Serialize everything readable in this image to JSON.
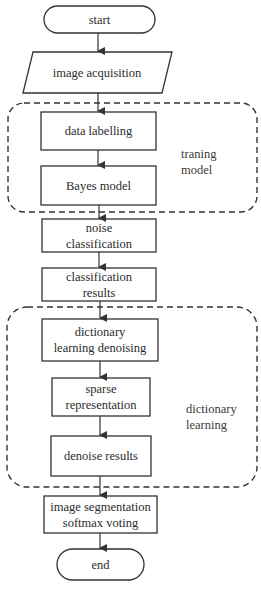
{
  "diagram": {
    "type": "flowchart",
    "stroke_color": "#333333",
    "background": "#ffffff",
    "nodes": [
      {
        "id": "start",
        "shape": "terminal",
        "label": "start"
      },
      {
        "id": "image_acquisition",
        "shape": "parallelogram",
        "label": "image acquisition"
      },
      {
        "id": "data_labelling",
        "shape": "process",
        "label": "data labelling"
      },
      {
        "id": "bayes_model",
        "shape": "process",
        "label": "Bayes model"
      },
      {
        "id": "noise_classification",
        "shape": "process",
        "label": "noise\nclassification"
      },
      {
        "id": "classification_results",
        "shape": "process",
        "label": "classification\nresults"
      },
      {
        "id": "dictionary_learning_denoising",
        "shape": "process",
        "label": "dictionary\nlearning denoising"
      },
      {
        "id": "sparse_representation",
        "shape": "process",
        "label": "sparse\nrepresentation"
      },
      {
        "id": "denoise_results",
        "shape": "process",
        "label": "denoise results"
      },
      {
        "id": "image_segmentation",
        "shape": "process",
        "label": "image segmentation\nsoftmax voting"
      },
      {
        "id": "end",
        "shape": "terminal",
        "label": "end"
      }
    ],
    "groups": [
      {
        "id": "training_model",
        "label": "traning\nmodel",
        "style": "dashed",
        "members": [
          "data_labelling",
          "bayes_model"
        ]
      },
      {
        "id": "dictionary_learning",
        "label": "dictionary\nlearning",
        "style": "dashed",
        "members": [
          "dictionary_learning_denoising",
          "sparse_representation",
          "denoise_results"
        ]
      }
    ],
    "edges": [
      [
        "start",
        "image_acquisition"
      ],
      [
        "image_acquisition",
        "data_labelling"
      ],
      [
        "data_labelling",
        "bayes_model"
      ],
      [
        "bayes_model",
        "noise_classification"
      ],
      [
        "noise_classification",
        "classification_results"
      ],
      [
        "classification_results",
        "dictionary_learning_denoising"
      ],
      [
        "dictionary_learning_denoising",
        "sparse_representation"
      ],
      [
        "sparse_representation",
        "denoise_results"
      ],
      [
        "denoise_results",
        "image_segmentation"
      ],
      [
        "image_segmentation",
        "end"
      ]
    ]
  },
  "labels": {
    "start": "start",
    "image_acquisition": "image acquisition",
    "data_labelling": "data labelling",
    "bayes_model": "Bayes model",
    "noise_classification": "noise\nclassification",
    "classification_results": "classification\nresults",
    "dictionary_learning_denoising": "dictionary\nlearning denoising",
    "sparse_representation": "sparse\nrepresentation",
    "denoise_results": "denoise results",
    "image_segmentation": "image segmentation\nsoftmax voting",
    "end": "end",
    "group_training": "traning\nmodel",
    "group_dictionary": "dictionary\nlearning"
  }
}
